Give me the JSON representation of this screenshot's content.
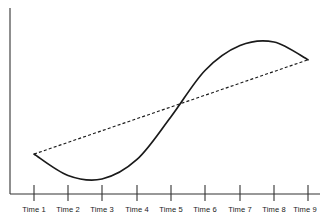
{
  "chart_data": {
    "type": "line",
    "title": "",
    "subtitle": "",
    "xlabel": "",
    "ylabel": "",
    "grid": false,
    "legend": null,
    "axes": {
      "x_axis_visible": true,
      "y_axis_visible": true,
      "x_tick_direction": "cross",
      "xlim": [
        1,
        9
      ],
      "ylim": [
        0,
        100
      ]
    },
    "categories": [
      "Time 1",
      "Time 2",
      "Time 3",
      "Time 4",
      "Time 5",
      "Time 6",
      "Time 7",
      "Time 8",
      "Time 9"
    ],
    "x": [
      1,
      2,
      3,
      4,
      5,
      6,
      7,
      8,
      9
    ],
    "series": [
      {
        "name": "actual-curve",
        "style": "solid",
        "color": "#1a1a1a",
        "values": [
          29,
          17,
          15,
          26,
          50,
          76,
          90,
          92,
          82
        ]
      },
      {
        "name": "trend-line",
        "style": "dashed",
        "color": "#1a1a1a",
        "values": [
          29,
          36,
          42,
          49,
          56,
          62,
          69,
          76,
          82
        ]
      }
    ],
    "annotations": [
      {
        "name": "crossing-point",
        "x": 5,
        "y": 50,
        "label": ""
      }
    ]
  },
  "ticks": [
    {
      "label": "Time 1",
      "x": 34
    },
    {
      "label": "Time 2",
      "x": 68
    },
    {
      "label": "Time 3",
      "x": 102
    },
    {
      "label": "Time 4",
      "x": 137
    },
    {
      "label": "Time 5",
      "x": 171
    },
    {
      "label": "Time 6",
      "x": 205
    },
    {
      "label": "Time 7",
      "x": 240
    },
    {
      "label": "Time 8",
      "x": 274
    },
    {
      "label": "Time 9",
      "x": 308
    }
  ],
  "colors": {
    "ink": "#1a1a1a",
    "axis": "#333333",
    "background": "#ffffff"
  }
}
